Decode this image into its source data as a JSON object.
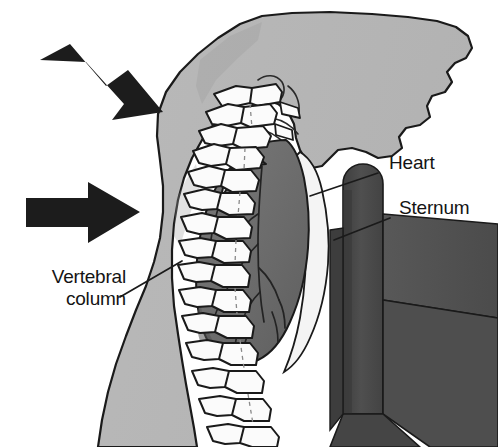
{
  "figure": {
    "type": "anatomical-illustration",
    "view": "lateral sagittal section of the thorax",
    "background_color": "#ffffff",
    "labels": [
      {
        "id": "heart",
        "text": "Heart",
        "x": 389,
        "y": 152,
        "leader_line": {
          "x1": 378,
          "y1": 174,
          "x2": 312,
          "y2": 196
        }
      },
      {
        "id": "sternum",
        "text": "Sternum",
        "x": 399,
        "y": 197,
        "leader_line": {
          "x1": 389,
          "y1": 219,
          "x2": 335,
          "y2": 240
        }
      },
      {
        "id": "vertebral-column",
        "text": "Vertebral column",
        "line_1": "Vertebral",
        "line_2": "column",
        "x": 18,
        "y": 266,
        "leader_line": {
          "x1": 120,
          "y1": 297,
          "x2": 181,
          "y2": 261
        }
      }
    ],
    "arrows": [
      {
        "id": "force-arrow-upper",
        "direction": "down-right",
        "angle_deg": 32,
        "tip_x": 162,
        "tip_y": 112,
        "tail_x": 42,
        "tail_y": 62,
        "color": "#1c1c1c"
      },
      {
        "id": "force-arrow-lower",
        "direction": "right",
        "angle_deg": 0,
        "tip_x": 138,
        "tip_y": 212,
        "tail_x": 26,
        "tail_y": 212,
        "color": "#1c1c1c"
      }
    ],
    "structures": [
      {
        "id": "body-torso",
        "name": "torso soft tissue",
        "fill": "#b6b6b6",
        "stroke": "#1a1a1a"
      },
      {
        "id": "vertebral-column",
        "name": "vertebral column",
        "fill": "#fbfbfb",
        "stroke": "#1a1a1a",
        "vertebra_count": 12
      },
      {
        "id": "heart",
        "name": "heart",
        "fill": "#6e6e6e",
        "stroke": "#1a1a1a"
      },
      {
        "id": "pericardial-space",
        "name": "pericardial space",
        "fill": "#f2f2f2",
        "stroke": "#1a1a1a"
      },
      {
        "id": "sternum",
        "name": "sternum",
        "fill": "#4a4a4a",
        "stroke": "#1a1a1a"
      },
      {
        "id": "sternum-flange",
        "name": "sternum flange",
        "fill": "#5a5a5a",
        "stroke": "#1a1a1a"
      }
    ],
    "colors": {
      "soft_tissue": "#b6b6b6",
      "bone": "#fbfbfb",
      "heart": "#6e6e6e",
      "sternum": "#4a4a4a",
      "outline": "#1a1a1a",
      "arrow": "#1c1c1c",
      "label_text": "#141414",
      "background": "#ffffff"
    }
  }
}
